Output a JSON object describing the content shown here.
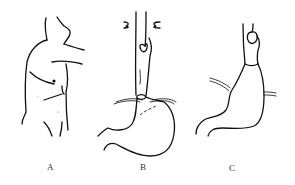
{
  "figure": {
    "panels": [
      {
        "label": "A",
        "description": "torso outline with arm raised"
      },
      {
        "label": "B",
        "description": "esophagus and stomach with lesion at gastroesophageal junction"
      },
      {
        "label": "C",
        "description": "esophagus and stomach, post-operative shape"
      }
    ],
    "colors": {
      "line": "#111111",
      "background": "#ffffff"
    }
  }
}
